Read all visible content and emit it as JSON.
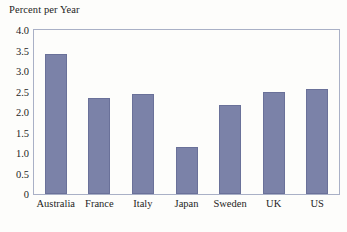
{
  "chart_data": {
    "type": "bar",
    "title": "",
    "ylabel": "Percent per Year",
    "xlabel": "",
    "categories": [
      "Australia",
      "France",
      "Italy",
      "Japan",
      "Sweden",
      "UK",
      "US"
    ],
    "values": [
      3.42,
      2.33,
      2.44,
      1.15,
      2.17,
      2.49,
      2.56
    ],
    "ylim": [
      0,
      4.0
    ],
    "y_ticks": [
      0,
      0.5,
      1.0,
      1.5,
      2.0,
      2.5,
      3.0,
      3.5,
      4.0
    ],
    "y_tick_labels": [
      "0",
      "0.5",
      "1.0",
      "1.5",
      "2.0",
      "2.5",
      "3.0",
      "3.5",
      "4.0"
    ],
    "grid": false,
    "legend": "none",
    "series": [
      {
        "name": "Percent per Year",
        "values": [
          3.42,
          2.33,
          2.44,
          1.15,
          2.17,
          2.49,
          2.56
        ]
      }
    ],
    "colors": {
      "bar_fill": "#7b82a8",
      "bar_edge": "#6a7199",
      "frame": "#a9b0c6",
      "text": "#1d1d1d",
      "background": "#fdfdfb"
    }
  }
}
